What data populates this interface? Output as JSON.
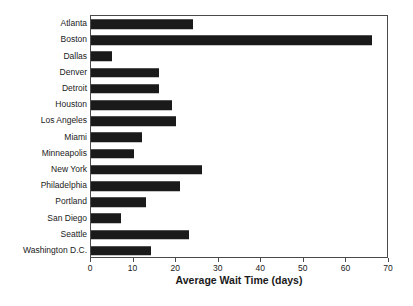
{
  "chart_data": {
    "type": "bar",
    "orientation": "horizontal",
    "title": "",
    "xlabel": "Average Wait Time (days)",
    "ylabel": "",
    "xlim": [
      0,
      70
    ],
    "xticks": [
      0,
      10,
      20,
      30,
      40,
      50,
      60,
      70
    ],
    "grid": false,
    "legend": null,
    "bar_color": "#1a1a1a",
    "background_color": "#ffffff",
    "frame_color": "#4a4a4a",
    "categories": [
      "Atlanta",
      "Boston",
      "Dallas",
      "Denver",
      "Detroit",
      "Houston",
      "Los Angeles",
      "Miami",
      "Minneapolis",
      "New York",
      "Philadelphia",
      "Portland",
      "San Diego",
      "Seattle",
      "Washington D.C."
    ],
    "values": [
      24,
      66,
      5,
      16,
      16,
      19,
      20,
      12,
      10,
      26,
      21,
      13,
      7,
      23,
      14
    ]
  }
}
